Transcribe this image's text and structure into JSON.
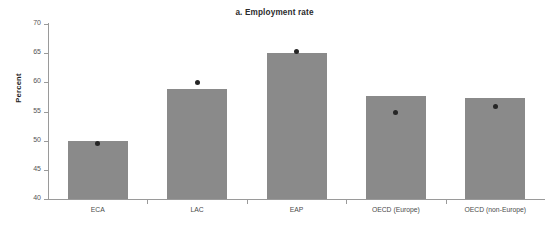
{
  "chart_data": {
    "type": "bar",
    "title": "a. Employment rate",
    "xlabel": "",
    "ylabel": "Percent",
    "ylim": [
      40,
      70
    ],
    "yticks": [
      40,
      45,
      50,
      55,
      60,
      65,
      70
    ],
    "grid": false,
    "legend": "none",
    "categories": [
      "ECA",
      "LAC",
      "EAP",
      "OECD (Europe)",
      "OECD (non-Europe)"
    ],
    "series": [
      {
        "name": "Employment rate",
        "type": "bar",
        "values": [
          50.0,
          58.8,
          65.0,
          57.6,
          57.4
        ]
      },
      {
        "name": "Marker",
        "type": "scatter",
        "values": [
          49.6,
          60.0,
          65.3,
          54.9,
          55.9
        ]
      }
    ],
    "colors": {
      "bar": "#8a8a8a",
      "marker": "#262626",
      "axis": "#9a9a9a",
      "title_text": "#2b2b2b",
      "tick_text": "#555555",
      "category_text": "#4a4a4a",
      "background": "#ffffff"
    }
  }
}
